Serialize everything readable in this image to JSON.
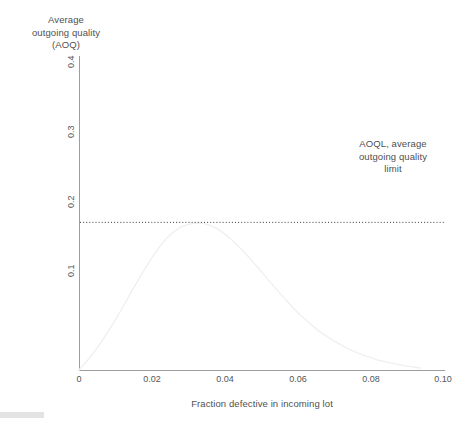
{
  "chart_data": {
    "type": "line",
    "title": "",
    "xlabel": "Fraction defective in incoming lot",
    "ylabel": "Average outgoing quality (AOQ)",
    "ylabel_lines": [
      "Average",
      "outgoing quality",
      "(AOQ)"
    ],
    "xlim": [
      0,
      0.1
    ],
    "ylim": [
      0,
      0.45
    ],
    "grid": false,
    "legend": null,
    "xticks": [
      0,
      0.02,
      0.04,
      0.06,
      0.08,
      0.1
    ],
    "xticklabels": [
      "0",
      "0.02",
      "0.04",
      "0.06",
      "0.08",
      "0.10"
    ],
    "yticks": [
      0.1,
      0.2,
      0.3,
      0.4
    ],
    "yticklabels": [
      "0.1",
      "0.2",
      "0.3",
      "0.4"
    ],
    "ytick_rotation": 90,
    "series": [
      {
        "name": "AOQ curve",
        "color": "#f0f0f0",
        "x": [
          0.0,
          0.002,
          0.004,
          0.006,
          0.008,
          0.01,
          0.012,
          0.014,
          0.016,
          0.018,
          0.02,
          0.022,
          0.024,
          0.026,
          0.028,
          0.03,
          0.032,
          0.034,
          0.036,
          0.038,
          0.04,
          0.042,
          0.044,
          0.046,
          0.048,
          0.05,
          0.052,
          0.054,
          0.056,
          0.058,
          0.06,
          0.062,
          0.064,
          0.066,
          0.068,
          0.07,
          0.074,
          0.078,
          0.082,
          0.086,
          0.09,
          0.094
        ],
        "y": [
          0.0,
          0.012,
          0.025,
          0.04,
          0.056,
          0.073,
          0.091,
          0.11,
          0.128,
          0.146,
          0.163,
          0.178,
          0.191,
          0.201,
          0.208,
          0.212,
          0.214,
          0.214,
          0.211,
          0.206,
          0.199,
          0.19,
          0.18,
          0.169,
          0.157,
          0.145,
          0.132,
          0.12,
          0.108,
          0.096,
          0.085,
          0.075,
          0.066,
          0.057,
          0.05,
          0.043,
          0.031,
          0.022,
          0.015,
          0.01,
          0.006,
          0.003
        ]
      }
    ],
    "annotations": [
      {
        "name": "aoql-limit-line",
        "type": "horizontal-dotted-line",
        "value": 0.215,
        "color": "#3a3a3a",
        "label_lines": [
          "AOQL, average",
          "outgoing quality",
          "limit"
        ]
      }
    ]
  },
  "axes": {
    "y_title_lines": [
      "Average",
      "outgoing quality",
      "(AOQ)"
    ],
    "x_title": "Fraction defective in incoming lot",
    "x_tick_labels": [
      "0",
      "0.02",
      "0.04",
      "0.06",
      "0.08",
      "0.10"
    ],
    "y_tick_labels": [
      "0.1",
      "0.2",
      "0.3",
      "0.4"
    ]
  },
  "annotation": {
    "line1": "AOQL, average",
    "line2": "outgoing quality",
    "line3": "limit"
  },
  "colors": {
    "axis": "#9d9d9d",
    "curve": "#f0f0f0",
    "dotted_line": "#3a3a3a",
    "text": "#4f4f4f",
    "background": "#ffffff"
  }
}
